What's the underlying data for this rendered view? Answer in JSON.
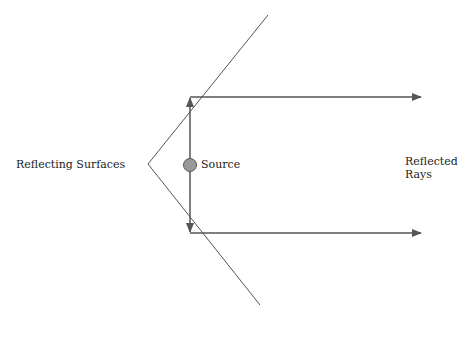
{
  "diagram": {
    "labels": {
      "surfaces": "Reflecting Surfaces",
      "source": "Source",
      "rays_line1": "Reflected",
      "rays_line2": "Rays"
    },
    "colors": {
      "mirror": "#555555",
      "ray": "#555555",
      "source_fill": "#999999",
      "source_stroke": "#555555"
    }
  }
}
